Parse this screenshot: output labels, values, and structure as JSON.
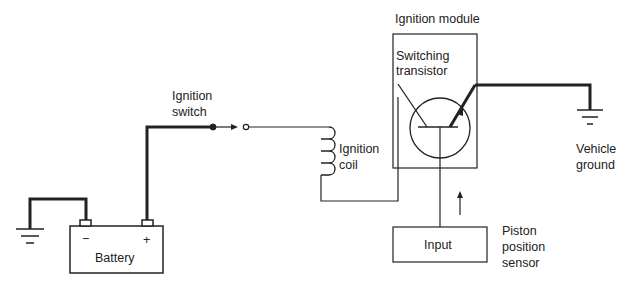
{
  "diagram": {
    "labels": {
      "ignition_switch": [
        "Ignition",
        "switch"
      ],
      "ignition_coil": [
        "Ignition",
        "coil"
      ],
      "ignition_module": "Ignition module",
      "switching_transistor": [
        "Switching",
        "transistor"
      ],
      "vehicle_ground": [
        "Vehicle",
        "ground"
      ],
      "battery": "Battery",
      "battery_neg": "−",
      "battery_pos": "+",
      "input": "Input",
      "piston_position_sensor": [
        "Piston",
        "position",
        "sensor"
      ]
    },
    "colors": {
      "line": "#222222",
      "background": "#ffffff"
    }
  }
}
